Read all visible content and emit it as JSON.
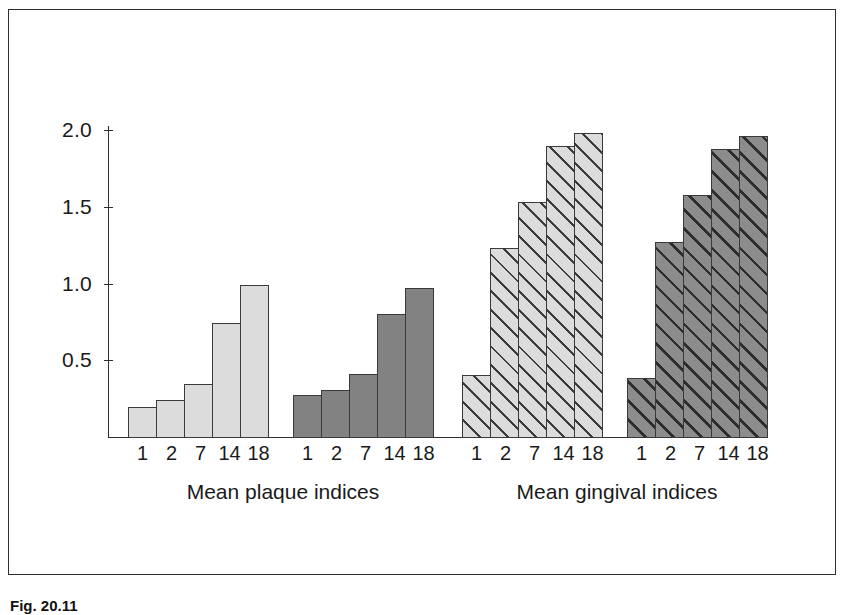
{
  "figure": {
    "caption_label": "Fig. 20.11",
    "caption_rest": ""
  },
  "chart_data": {
    "type": "bar",
    "title": "",
    "xlabel": "",
    "ylabel": "",
    "ylim": [
      0,
      2.1
    ],
    "ytick_values": [
      0.5,
      1.0,
      1.5,
      2.0
    ],
    "ytick_labels": [
      "0.5",
      "1.0",
      "1.5",
      "2.0"
    ],
    "grid": false,
    "legend": "none",
    "categories": [
      "1",
      "2",
      "7",
      "14",
      "18"
    ],
    "category_axis_note": "weeks",
    "panels": [
      {
        "label": "Mean plaque indices",
        "series": [
          {
            "name": "plaque-light",
            "fill": "solid-light",
            "color": "#dcdcdc",
            "values": [
              0.2,
              0.25,
              0.35,
              0.75,
              1.0
            ]
          },
          {
            "name": "plaque-dark",
            "fill": "solid-dark",
            "color": "#828282",
            "values": [
              0.28,
              0.31,
              0.42,
              0.81,
              0.98
            ]
          }
        ]
      },
      {
        "label": "Mean gingival indices",
        "series": [
          {
            "name": "gingival-light",
            "fill": "hatch-light",
            "color": "#dcdcdc",
            "values": [
              0.41,
              1.24,
              1.54,
              1.9,
              1.99
            ]
          },
          {
            "name": "gingival-dark",
            "fill": "hatch-dark",
            "color": "#8c8c8c",
            "values": [
              0.39,
              1.28,
              1.58,
              1.88,
              1.97
            ]
          }
        ]
      }
    ]
  }
}
